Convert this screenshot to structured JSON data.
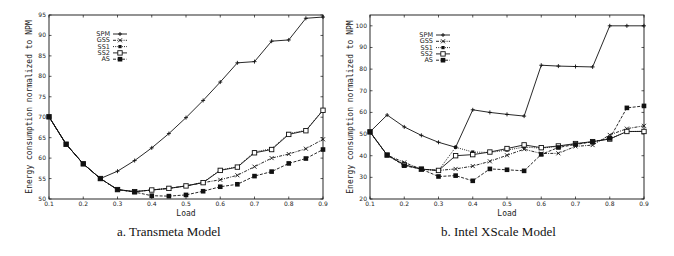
{
  "chart_data": [
    {
      "type": "line",
      "title": "a. Transmeta Model",
      "xlabel": "Load",
      "ylabel": "Energy consumption normalized to NPM",
      "xlim": [
        0.1,
        0.9
      ],
      "ylim": [
        50,
        95
      ],
      "xticks": [
        "0.1",
        "0.2",
        "0.3",
        "0.4",
        "0.5",
        "0.6",
        "0.7",
        "0.8",
        "0.9"
      ],
      "yticks": [
        50,
        55,
        60,
        65,
        70,
        75,
        80,
        85,
        90,
        95
      ],
      "grid": false,
      "legend_position": "upper-left",
      "x": [
        0.1,
        0.15,
        0.2,
        0.25,
        0.3,
        0.35,
        0.4,
        0.45,
        0.5,
        0.55,
        0.6,
        0.65,
        0.7,
        0.75,
        0.8,
        0.85,
        0.9
      ],
      "series": [
        {
          "name": "SPM",
          "marker": "plus",
          "dash": "solid",
          "values": [
            70.1,
            63.4,
            58.6,
            55.0,
            56.8,
            59.4,
            62.5,
            66.0,
            69.9,
            74.1,
            78.6,
            83.3,
            83.6,
            88.6,
            88.9,
            94.2,
            94.5
          ]
        },
        {
          "name": "GSS",
          "marker": "x",
          "dash": "dashdot",
          "values": [
            70.1,
            63.4,
            58.6,
            55.0,
            52.3,
            51.8,
            52.2,
            52.6,
            53.2,
            54.0,
            54.7,
            55.8,
            57.9,
            60.0,
            61.0,
            62.3,
            64.6
          ]
        },
        {
          "name": "SS1",
          "marker": "filled-square-small",
          "dash": "dotted",
          "values": [
            70.1,
            63.4,
            58.6,
            55.0,
            52.3,
            51.8,
            52.2,
            52.6,
            53.2,
            54.1,
            57.1,
            57.9,
            61.5,
            62.3,
            66.0,
            66.8,
            71.8
          ]
        },
        {
          "name": "SS2",
          "marker": "open-square",
          "dash": "solid",
          "values": [
            70.1,
            63.4,
            58.6,
            55.0,
            52.3,
            51.8,
            52.2,
            52.6,
            53.2,
            54.0,
            57.0,
            57.8,
            61.3,
            62.1,
            65.8,
            66.7,
            71.7
          ]
        },
        {
          "name": "AS",
          "marker": "filled-square",
          "dash": "dashed",
          "values": [
            70.1,
            63.4,
            58.6,
            55.0,
            52.3,
            51.7,
            50.8,
            50.7,
            51.0,
            51.9,
            53.0,
            53.6,
            55.6,
            56.7,
            58.7,
            59.9,
            62.1
          ]
        }
      ]
    },
    {
      "type": "line",
      "title": "b. Intel XScale Model",
      "xlabel": "Load",
      "ylabel": "Energy consumption normalized to NPM",
      "xlim": [
        0.1,
        0.9
      ],
      "ylim": [
        20,
        105
      ],
      "xticks": [
        "0.1",
        "0.2",
        "0.3",
        "0.4",
        "0.5",
        "0.6",
        "0.7",
        "0.8",
        "0.9"
      ],
      "yticks": [
        20,
        30,
        40,
        50,
        60,
        70,
        80,
        90,
        100
      ],
      "grid": false,
      "legend_position": "upper-left",
      "x": [
        0.1,
        0.15,
        0.2,
        0.25,
        0.3,
        0.35,
        0.4,
        0.45,
        0.5,
        0.55,
        0.6,
        0.65,
        0.7,
        0.75,
        0.8,
        0.85,
        0.9
      ],
      "series": [
        {
          "name": "SPM",
          "marker": "plus",
          "dash": "solid",
          "values": [
            51.0,
            58.8,
            53.3,
            49.4,
            46.2,
            43.9,
            61.2,
            60.0,
            59.1,
            58.3,
            81.8,
            81.4,
            81.2,
            81.0,
            100.0,
            100.0,
            100.0
          ]
        },
        {
          "name": "GSS",
          "marker": "x",
          "dash": "dashdot",
          "values": [
            51.0,
            40.3,
            36.9,
            33.8,
            33.2,
            33.9,
            35.2,
            37.4,
            40.2,
            43.0,
            41.0,
            41.1,
            44.3,
            44.9,
            49.6,
            52.5,
            53.8
          ]
        },
        {
          "name": "SS1",
          "marker": "filled-square-small",
          "dash": "dotted",
          "values": [
            51.0,
            40.3,
            35.8,
            33.8,
            33.2,
            43.9,
            41.7,
            41.5,
            42.6,
            44.0,
            43.5,
            44.3,
            45.4,
            46.5,
            47.8,
            51.1,
            51.3
          ]
        },
        {
          "name": "SS2",
          "marker": "open-square",
          "dash": "solid",
          "values": [
            51.0,
            40.3,
            35.8,
            33.8,
            33.2,
            40.0,
            40.5,
            41.7,
            43.3,
            45.0,
            43.7,
            44.5,
            45.6,
            46.5,
            47.7,
            51.2,
            51.2
          ]
        },
        {
          "name": "AS",
          "marker": "filled-square",
          "dash": "dashed",
          "values": [
            51.0,
            40.3,
            35.4,
            33.8,
            30.4,
            30.8,
            28.4,
            33.9,
            33.5,
            33.0,
            40.6,
            43.8,
            45.2,
            46.4,
            48.0,
            62.1,
            63.0
          ]
        }
      ]
    }
  ],
  "captions": {
    "left": "a. Transmeta Model",
    "right": "b. Intel XScale Model"
  }
}
